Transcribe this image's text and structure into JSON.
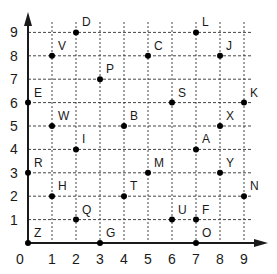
{
  "chart_data": {
    "type": "scatter",
    "title": "",
    "xlabel": "",
    "ylabel": "",
    "xlim": [
      0,
      9
    ],
    "ylim": [
      0,
      9
    ],
    "grid": true,
    "x_ticks": [
      "0",
      "1",
      "2",
      "3",
      "4",
      "5",
      "6",
      "7",
      "8",
      "9"
    ],
    "y_ticks": [
      "1",
      "2",
      "3",
      "4",
      "5",
      "6",
      "7",
      "8",
      "9"
    ],
    "points": [
      {
        "label": "D",
        "x": 2,
        "y": 9
      },
      {
        "label": "L",
        "x": 7,
        "y": 9
      },
      {
        "label": "V",
        "x": 1,
        "y": 8
      },
      {
        "label": "C",
        "x": 5,
        "y": 8
      },
      {
        "label": "J",
        "x": 8,
        "y": 8
      },
      {
        "label": "P",
        "x": 3,
        "y": 7
      },
      {
        "label": "E",
        "x": 0,
        "y": 6
      },
      {
        "label": "S",
        "x": 6,
        "y": 6
      },
      {
        "label": "K",
        "x": 9,
        "y": 6
      },
      {
        "label": "W",
        "x": 1,
        "y": 5
      },
      {
        "label": "B",
        "x": 4,
        "y": 5
      },
      {
        "label": "X",
        "x": 8,
        "y": 5
      },
      {
        "label": "I",
        "x": 2,
        "y": 4
      },
      {
        "label": "A",
        "x": 7,
        "y": 4
      },
      {
        "label": "R",
        "x": 0,
        "y": 3
      },
      {
        "label": "M",
        "x": 5,
        "y": 3
      },
      {
        "label": "Y",
        "x": 8,
        "y": 3
      },
      {
        "label": "H",
        "x": 1,
        "y": 2
      },
      {
        "label": "T",
        "x": 4,
        "y": 2
      },
      {
        "label": "N",
        "x": 9,
        "y": 2
      },
      {
        "label": "Q",
        "x": 2,
        "y": 1
      },
      {
        "label": "U",
        "x": 6,
        "y": 1
      },
      {
        "label": "F",
        "x": 7,
        "y": 1
      },
      {
        "label": "Z",
        "x": 0,
        "y": 0
      },
      {
        "label": "G",
        "x": 3,
        "y": 0
      },
      {
        "label": "O",
        "x": 7,
        "y": 0
      }
    ]
  },
  "colors": {
    "axis": "#1a1a1a",
    "grid": "#444444",
    "point": "#000000"
  }
}
